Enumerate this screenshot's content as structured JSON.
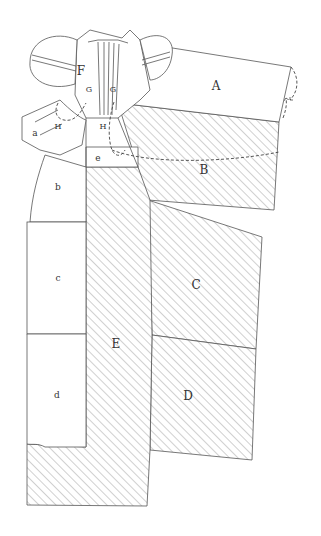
{
  "diagram": {
    "type": "dress-pattern-layout",
    "labels": {
      "A": "A",
      "B": "B",
      "C": "C",
      "D": "D",
      "E": "E",
      "F": "F",
      "G_left": "G",
      "G_right": "G",
      "H_left": "H",
      "H_right": "H",
      "a": "a",
      "b": "b",
      "c": "c",
      "d": "d",
      "e": "e"
    },
    "colors": {
      "line": "#555555",
      "hatch": "#888888",
      "text": "#333333",
      "background": "#ffffff"
    }
  }
}
